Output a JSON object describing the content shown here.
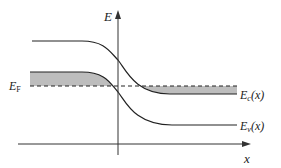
{
  "diagram": {
    "type": "band-diagram",
    "axes": {
      "y_label": "E",
      "x_label": "x"
    },
    "labels": {
      "fermi_main": "E",
      "fermi_sub": "F",
      "conduction_main": "E",
      "conduction_sub": "c",
      "conduction_arg": "(x)",
      "valence_main": "E",
      "valence_sub": "v",
      "valence_arg": "(x)"
    },
    "colors": {
      "line": "#222222",
      "shade": "#bdbdbd",
      "background": "#ffffff"
    }
  }
}
